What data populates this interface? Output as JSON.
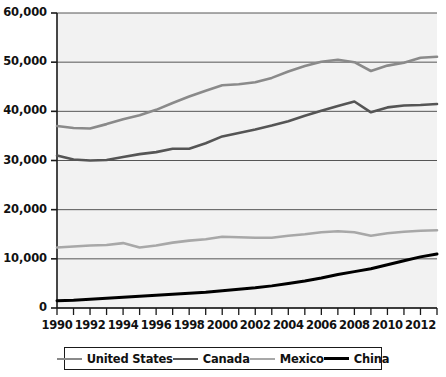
{
  "chart_data": {
    "type": "line",
    "title": "",
    "subtitle": "",
    "xlabel": "",
    "ylabel": "",
    "xlim": [
      1990,
      2013
    ],
    "ylim": [
      0,
      60000
    ],
    "ytick_step": 10000,
    "xtick_step": 2,
    "minor_xticks_every": 1,
    "grid": true,
    "grid_axis": "y",
    "legend_position": "bottom",
    "plot_background": "#f2f2f2",
    "x": [
      1990,
      1991,
      1992,
      1993,
      1994,
      1995,
      1996,
      1997,
      1998,
      1999,
      2000,
      2001,
      2002,
      2003,
      2004,
      2005,
      2006,
      2007,
      2008,
      2009,
      2010,
      2011,
      2012,
      2013
    ],
    "xtick_labels": [
      "1990",
      "1992",
      "1994",
      "1996",
      "1998",
      "2000",
      "2002",
      "2004",
      "2006",
      "2008",
      "2010",
      "2012"
    ],
    "xtick_values": [
      1990,
      1992,
      1994,
      1996,
      1998,
      2000,
      2002,
      2004,
      2006,
      2008,
      2010,
      2012
    ],
    "ytick_labels": [
      "0",
      "10,000",
      "20,000",
      "30,000",
      "40,000",
      "50,000",
      "60,000"
    ],
    "ytick_values": [
      0,
      10000,
      20000,
      30000,
      40000,
      50000,
      60000
    ],
    "series": [
      {
        "name": "United States",
        "color": "#8a8a8a",
        "width": 2.6,
        "values": [
          37000,
          36600,
          36500,
          37400,
          38400,
          39200,
          40300,
          41700,
          43000,
          44200,
          45300,
          45500,
          45900,
          46800,
          48100,
          49200,
          50100,
          50500,
          50000,
          48200,
          49300,
          49900,
          50900,
          51100
        ]
      },
      {
        "name": "Canada",
        "color": "#555555",
        "width": 2.6,
        "values": [
          31000,
          30200,
          30000,
          30100,
          30700,
          31300,
          31700,
          32400,
          32400,
          33500,
          34900,
          35600,
          36300,
          37100,
          38000,
          39100,
          40100,
          41100,
          42000,
          39800,
          40800,
          41200,
          41300,
          41500
        ]
      },
      {
        "name": "Mexico",
        "color": "#a8a8a8",
        "width": 2.6,
        "values": [
          12300,
          12500,
          12700,
          12800,
          13200,
          12300,
          12700,
          13300,
          13700,
          14000,
          14500,
          14400,
          14300,
          14300,
          14700,
          15000,
          15400,
          15600,
          15400,
          14700,
          15200,
          15500,
          15700,
          15800
        ]
      },
      {
        "name": "China",
        "color": "#000000",
        "width": 3.0,
        "values": [
          1500,
          1600,
          1800,
          2000,
          2200,
          2400,
          2600,
          2800,
          3000,
          3200,
          3500,
          3800,
          4100,
          4500,
          5000,
          5500,
          6100,
          6800,
          7400,
          8000,
          8800,
          9600,
          10400,
          11000
        ]
      }
    ]
  },
  "legend": {
    "items": [
      {
        "label": "United States",
        "color": "#8a8a8a",
        "thickness": 2.6
      },
      {
        "label": "Canada",
        "color": "#555555",
        "thickness": 2.8
      },
      {
        "label": "Mexico",
        "color": "#a8a8a8",
        "thickness": 2.4
      },
      {
        "label": "China",
        "color": "#000000",
        "thickness": 3.4
      }
    ]
  }
}
